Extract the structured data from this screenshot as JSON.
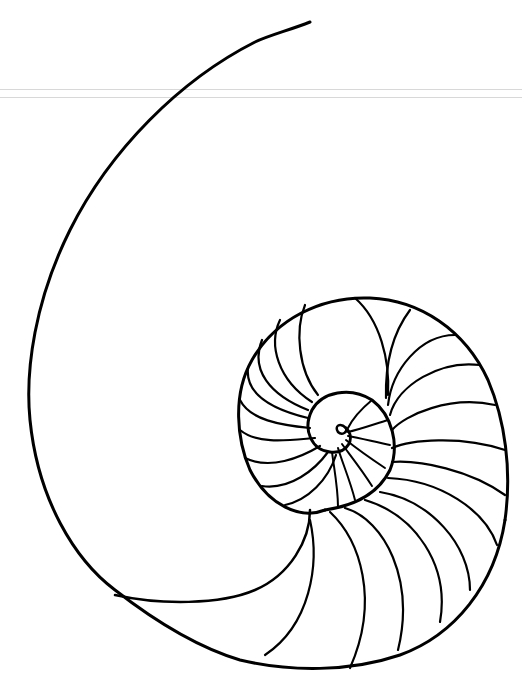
{
  "image": {
    "subject": "nautilus-shell-line-drawing",
    "colors": {
      "background": "#ffffff",
      "ink": "#000000",
      "scanline": "#d8d8d8"
    }
  }
}
